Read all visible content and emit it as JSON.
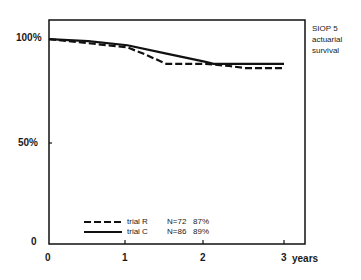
{
  "chart_data": {
    "type": "line",
    "title": "SIOP 5 actuarial survival",
    "xlabel": "years",
    "ylabel": "",
    "x_ticks": [
      "0",
      "1",
      "2",
      "3"
    ],
    "y_ticks": [
      "0",
      "50%",
      "100%"
    ],
    "xlim": [
      0,
      3
    ],
    "ylim": [
      0,
      100
    ],
    "grid": false,
    "legend_position": "lower-left inside",
    "series": [
      {
        "name": "trial R",
        "style": "dashed",
        "n": "N=72",
        "final": "87%",
        "x": [
          0,
          0.5,
          1.0,
          1.2,
          1.5,
          2.0,
          2.3,
          2.5,
          3.0
        ],
        "y": [
          99,
          97,
          95,
          92,
          87,
          87,
          86,
          85,
          85
        ]
      },
      {
        "name": "trial C",
        "style": "solid",
        "n": "N=86",
        "final": "89%",
        "x": [
          0,
          0.5,
          1.0,
          1.5,
          2.0,
          2.1,
          2.5,
          3.0
        ],
        "y": [
          99,
          98,
          96,
          92,
          88,
          87,
          87,
          87
        ]
      }
    ]
  },
  "labels": {
    "y100": "100%",
    "y50": "50%",
    "y0": "0",
    "x0": "0",
    "x1": "1",
    "x2": "2",
    "x3": "3",
    "xunit": "years",
    "side_line1": "SIOP 5",
    "side_line2": "actuarial",
    "side_line3": "survival"
  },
  "legend": [
    {
      "label": "trial R",
      "n": "N=72",
      "pct": "87%"
    },
    {
      "label": "trial C",
      "n": "N=86",
      "pct": "89%"
    }
  ]
}
